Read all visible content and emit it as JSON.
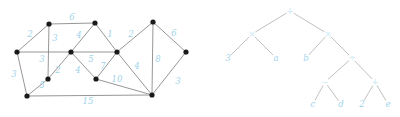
{
  "figure": {
    "caption": "",
    "panels": [
      {
        "id": "left",
        "name": "weighted-graph"
      },
      {
        "id": "right",
        "name": "expression-tree"
      }
    ]
  },
  "chart_data": [
    {
      "type": "diagram",
      "subtype": "weighted-undirected-graph",
      "title": "",
      "nodes": [
        {
          "id": "v1",
          "label": "",
          "x": 17,
          "y": 52
        },
        {
          "id": "v2",
          "label": "",
          "x": 49,
          "y": 24
        },
        {
          "id": "v3",
          "label": "",
          "x": 95,
          "y": 23
        },
        {
          "id": "v4",
          "label": "",
          "x": 71,
          "y": 52
        },
        {
          "id": "v5",
          "label": "",
          "x": 48,
          "y": 79
        },
        {
          "id": "v6",
          "label": "",
          "x": 27,
          "y": 96
        },
        {
          "id": "v7",
          "label": "",
          "x": 117,
          "y": 52
        },
        {
          "id": "v8",
          "label": "",
          "x": 96,
          "y": 79
        },
        {
          "id": "v9",
          "label": "",
          "x": 153,
          "y": 22
        },
        {
          "id": "v10",
          "label": "",
          "x": 186,
          "y": 52
        },
        {
          "id": "v11",
          "label": "",
          "x": 152,
          "y": 95
        }
      ],
      "edges": [
        {
          "from": "v1",
          "to": "v2",
          "weight": 2,
          "lx": 30,
          "ly": 34
        },
        {
          "from": "v2",
          "to": "v3",
          "weight": 6,
          "lx": 72,
          "ly": 17
        },
        {
          "from": "v2",
          "to": "v5",
          "weight": 3,
          "lx": 55,
          "ly": 38
        },
        {
          "from": "v1",
          "to": "v4",
          "weight": 3,
          "lx": 42,
          "ly": 59
        },
        {
          "from": "v1",
          "to": "v6",
          "weight": 3,
          "lx": 14,
          "ly": 74
        },
        {
          "from": "v5",
          "to": "v6",
          "weight": 5,
          "lx": 42,
          "ly": 85
        },
        {
          "from": "v4",
          "to": "v5",
          "weight": 2,
          "lx": 58,
          "ly": 70
        },
        {
          "from": "v3",
          "to": "v4",
          "weight": 4,
          "lx": 79,
          "ly": 35
        },
        {
          "from": "v4",
          "to": "v8",
          "weight": 4,
          "lx": 78,
          "ly": 70
        },
        {
          "from": "v4",
          "to": "v7",
          "weight": 5,
          "lx": 91,
          "ly": 59
        },
        {
          "from": "v3",
          "to": "v7",
          "weight": 1,
          "lx": 110,
          "ly": 34
        },
        {
          "from": "v7",
          "to": "v8",
          "weight": 7,
          "lx": 103,
          "ly": 66
        },
        {
          "from": "v8",
          "to": "v11",
          "weight": 10,
          "lx": 117,
          "ly": 79
        },
        {
          "from": "v6",
          "to": "v11",
          "weight": 15,
          "lx": 88,
          "ly": 101
        },
        {
          "from": "v7",
          "to": "v9",
          "weight": 2,
          "lx": 131,
          "ly": 34
        },
        {
          "from": "v9",
          "to": "v10",
          "weight": 6,
          "lx": 174,
          "ly": 33
        },
        {
          "from": "v9",
          "to": "v11",
          "weight": 8,
          "lx": 158,
          "ly": 59
        },
        {
          "from": "v7",
          "to": "v11",
          "weight": 4,
          "lx": 137,
          "ly": 66
        },
        {
          "from": "v10",
          "to": "v11",
          "weight": 3,
          "lx": 178,
          "ly": 81
        }
      ],
      "weight_color": "#9fd3ea",
      "node_color": "#1a1a1a",
      "edge_color": "#8a8a8a"
    },
    {
      "type": "diagram",
      "subtype": "binary-expression-tree",
      "title": "",
      "expression": "3 × a + (b ÷ ((c − d) × (2 + e)))",
      "node_color": "#c9e7f4",
      "edge_color": "#b9b9b9",
      "nodes": [
        {
          "id": "n1",
          "label": "+",
          "x": 290,
          "y": 11,
          "kind": "operator"
        },
        {
          "id": "n2",
          "label": "×",
          "x": 252,
          "y": 34,
          "kind": "operator"
        },
        {
          "id": "n3",
          "label": "×",
          "x": 328,
          "y": 34,
          "kind": "operator"
        },
        {
          "id": "n4",
          "label": "3",
          "x": 228,
          "y": 58,
          "kind": "leaf"
        },
        {
          "id": "n5",
          "label": "a",
          "x": 276,
          "y": 58,
          "kind": "leaf"
        },
        {
          "id": "n6",
          "label": "b",
          "x": 306,
          "y": 58,
          "kind": "leaf"
        },
        {
          "id": "n7",
          "label": "÷",
          "x": 352,
          "y": 58,
          "kind": "operator"
        },
        {
          "id": "n8",
          "label": "−",
          "x": 325,
          "y": 82,
          "kind": "operator"
        },
        {
          "id": "n9",
          "label": "+",
          "x": 375,
          "y": 82,
          "kind": "operator"
        },
        {
          "id": "n10",
          "label": "c",
          "x": 313,
          "y": 104,
          "kind": "leaf"
        },
        {
          "id": "n11",
          "label": "d",
          "x": 341,
          "y": 104,
          "kind": "leaf"
        },
        {
          "id": "n12",
          "label": "2",
          "x": 362,
          "y": 104,
          "kind": "leaf"
        },
        {
          "id": "n13",
          "label": "e",
          "x": 388,
          "y": 104,
          "kind": "leaf"
        }
      ],
      "edges": [
        {
          "from": "n1",
          "to": "n2"
        },
        {
          "from": "n1",
          "to": "n3"
        },
        {
          "from": "n2",
          "to": "n4"
        },
        {
          "from": "n2",
          "to": "n5"
        },
        {
          "from": "n3",
          "to": "n6"
        },
        {
          "from": "n3",
          "to": "n7"
        },
        {
          "from": "n7",
          "to": "n8"
        },
        {
          "from": "n7",
          "to": "n9"
        },
        {
          "from": "n8",
          "to": "n10"
        },
        {
          "from": "n8",
          "to": "n11"
        },
        {
          "from": "n9",
          "to": "n12"
        },
        {
          "from": "n9",
          "to": "n13"
        }
      ]
    }
  ]
}
